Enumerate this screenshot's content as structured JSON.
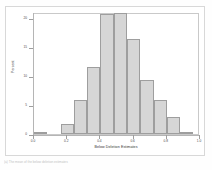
{
  "figure": {
    "caption": "(a) The mean of the below deletion estimates"
  },
  "chart_data": {
    "type": "bar",
    "title": "",
    "xlabel": "Below Deletion Estimates",
    "ylabel": "Percent",
    "xlim": [
      0.0,
      1.0
    ],
    "ylim": [
      0,
      21
    ],
    "grid": false,
    "legend": "none",
    "bin_width": 0.08,
    "categories": [
      "0.04",
      "0.12",
      "0.20",
      "0.28",
      "0.36",
      "0.44",
      "0.52",
      "0.60",
      "0.68",
      "0.76",
      "0.84",
      "0.92"
    ],
    "bin_starts": [
      0.0,
      0.08,
      0.16,
      0.24,
      0.32,
      0.4,
      0.48,
      0.56,
      0.64,
      0.72,
      0.8,
      0.88
    ],
    "values": [
      0.4,
      0.0,
      1.7,
      5.8,
      11.5,
      20.6,
      20.8,
      16.3,
      9.3,
      5.8,
      3.0,
      0.3
    ],
    "xticks": [
      "0.0",
      "0.2",
      "0.4",
      "0.6",
      "0.8",
      "1.0"
    ],
    "xtick_values": [
      0.0,
      0.2,
      0.4,
      0.6,
      0.8,
      1.0
    ],
    "yticks": [
      "0",
      "5",
      "10",
      "15",
      "20"
    ],
    "ytick_values": [
      0,
      5,
      10,
      15,
      20
    ],
    "bar_fill": "#d6d6d6",
    "bar_edge": "#9e9e9e",
    "frame_color": "#c9c9c9",
    "axis_color": "#b5b5b5"
  }
}
